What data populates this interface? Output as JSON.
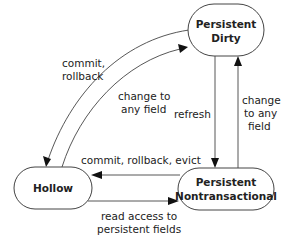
{
  "diagram": {
    "type": "state-transition",
    "nodes": [
      {
        "id": "persistent-dirty",
        "lines": [
          "Persistent",
          "Dirty"
        ]
      },
      {
        "id": "hollow",
        "lines": [
          "Hollow"
        ]
      },
      {
        "id": "persistent-nontransactional",
        "lines": [
          "Persistent",
          "Nontransactional"
        ]
      }
    ],
    "edges": [
      {
        "from": "persistent-dirty",
        "to": "hollow",
        "lines": [
          "commit,",
          "rollback"
        ]
      },
      {
        "from": "hollow",
        "to": "persistent-dirty",
        "lines": [
          "change to",
          "any field"
        ]
      },
      {
        "from": "persistent-dirty",
        "to": "persistent-nontransactional",
        "lines": [
          "refresh"
        ]
      },
      {
        "from": "persistent-nontransactional",
        "to": "persistent-dirty",
        "lines": [
          "change",
          "to any",
          "field"
        ]
      },
      {
        "from": "persistent-nontransactional",
        "to": "hollow",
        "lines": [
          "commit, rollback, evict"
        ]
      },
      {
        "from": "hollow",
        "to": "persistent-nontransactional",
        "lines": [
          "read access to",
          "persistent fields"
        ]
      }
    ]
  }
}
